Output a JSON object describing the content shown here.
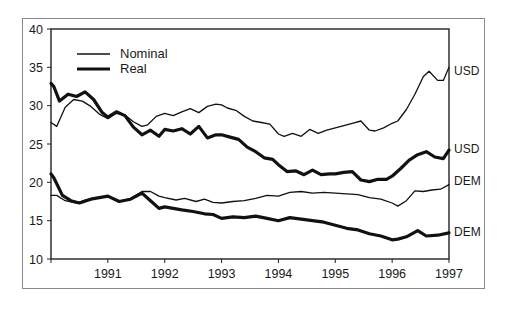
{
  "chart_data": {
    "type": "line",
    "title": "",
    "xlabel": "",
    "ylabel": "",
    "xlim": [
      1990.0,
      1997.0
    ],
    "ylim": [
      10,
      40
    ],
    "y_ticks": [
      10,
      15,
      20,
      25,
      30,
      35,
      40
    ],
    "x_ticks": [
      1991,
      1992,
      1993,
      1994,
      1995,
      1996,
      1997
    ],
    "x_tick_labels": [
      "1991",
      "1992",
      "1993",
      "1994",
      "1995",
      "1996",
      "1997"
    ],
    "grid": false,
    "legend": {
      "position": "upper-left-inside",
      "entries": [
        {
          "label": "Nominal",
          "style": "thin"
        },
        {
          "label": "Real",
          "style": "thick"
        }
      ]
    },
    "series": [
      {
        "name": "USD Nominal",
        "style": "thin",
        "end_label": "USD",
        "x": [
          1990.0,
          1990.1,
          1990.25,
          1990.4,
          1990.55,
          1990.7,
          1990.85,
          1991.0,
          1991.15,
          1991.3,
          1991.45,
          1991.6,
          1991.7,
          1991.85,
          1992.0,
          1992.15,
          1992.3,
          1992.45,
          1992.6,
          1992.75,
          1992.9,
          1993.0,
          1993.1,
          1993.25,
          1993.4,
          1993.55,
          1993.7,
          1993.85,
          1994.0,
          1994.1,
          1994.25,
          1994.4,
          1994.55,
          1994.7,
          1994.85,
          1995.0,
          1995.15,
          1995.3,
          1995.45,
          1995.6,
          1995.7,
          1995.85,
          1996.0,
          1996.1,
          1996.25,
          1996.4,
          1996.55,
          1996.65,
          1996.8,
          1996.9,
          1997.0
        ],
        "values": [
          27.8,
          27.3,
          29.8,
          30.8,
          30.6,
          29.9,
          28.9,
          28.3,
          29.0,
          28.8,
          27.9,
          27.3,
          27.5,
          28.6,
          29.0,
          28.7,
          29.2,
          29.6,
          29.1,
          29.9,
          30.2,
          30.1,
          29.7,
          29.4,
          28.6,
          28.0,
          27.8,
          27.6,
          26.3,
          26.0,
          26.4,
          26.0,
          26.9,
          26.4,
          26.8,
          27.1,
          27.4,
          27.7,
          28.0,
          26.8,
          26.7,
          27.1,
          27.7,
          28.0,
          29.5,
          31.5,
          33.8,
          34.5,
          33.3,
          33.3,
          35.0
        ]
      },
      {
        "name": "USD Real",
        "style": "thick",
        "end_label": "USD",
        "x": [
          1990.0,
          1990.05,
          1990.15,
          1990.3,
          1990.45,
          1990.6,
          1990.75,
          1990.9,
          1991.0,
          1991.15,
          1991.3,
          1991.45,
          1991.6,
          1991.75,
          1991.9,
          1992.0,
          1992.15,
          1992.3,
          1992.45,
          1992.6,
          1992.75,
          1992.9,
          1993.0,
          1993.15,
          1993.3,
          1993.45,
          1993.6,
          1993.75,
          1993.9,
          1994.0,
          1994.15,
          1994.3,
          1994.45,
          1994.6,
          1994.75,
          1994.9,
          1995.0,
          1995.15,
          1995.3,
          1995.45,
          1995.6,
          1995.75,
          1995.9,
          1996.0,
          1996.15,
          1996.3,
          1996.45,
          1996.6,
          1996.75,
          1996.9,
          1997.0
        ],
        "values": [
          32.9,
          32.5,
          30.6,
          31.5,
          31.2,
          31.8,
          30.8,
          29.1,
          28.5,
          29.2,
          28.7,
          27.2,
          26.2,
          26.8,
          26.0,
          26.9,
          26.7,
          27.0,
          26.3,
          27.3,
          25.8,
          26.2,
          26.2,
          25.9,
          25.6,
          24.6,
          24.0,
          23.2,
          23.0,
          22.3,
          21.4,
          21.5,
          21.0,
          21.6,
          21.0,
          21.1,
          21.1,
          21.3,
          21.4,
          20.3,
          20.1,
          20.4,
          20.4,
          20.8,
          21.8,
          22.9,
          23.6,
          24.0,
          23.3,
          23.1,
          24.2
        ]
      },
      {
        "name": "DEM Nominal",
        "style": "thin",
        "end_label": "DEM",
        "x": [
          1990.0,
          1990.1,
          1990.25,
          1990.45,
          1990.6,
          1990.8,
          1991.0,
          1991.2,
          1991.4,
          1991.6,
          1991.75,
          1991.9,
          1992.0,
          1992.2,
          1992.35,
          1992.55,
          1992.7,
          1992.85,
          1993.0,
          1993.2,
          1993.4,
          1993.6,
          1993.8,
          1994.0,
          1994.2,
          1994.4,
          1994.6,
          1994.8,
          1995.0,
          1995.2,
          1995.4,
          1995.6,
          1995.8,
          1996.0,
          1996.1,
          1996.25,
          1996.4,
          1996.55,
          1996.7,
          1996.85,
          1997.0
        ],
        "values": [
          18.3,
          18.3,
          17.6,
          17.3,
          17.7,
          18.0,
          18.2,
          17.5,
          17.9,
          18.8,
          18.8,
          18.2,
          18.0,
          17.7,
          17.9,
          17.5,
          17.8,
          17.4,
          17.3,
          17.5,
          17.6,
          17.9,
          18.3,
          18.2,
          18.7,
          18.8,
          18.6,
          18.7,
          18.6,
          18.5,
          18.4,
          18.0,
          17.8,
          17.3,
          16.9,
          17.6,
          18.9,
          18.8,
          19.0,
          19.1,
          19.7
        ]
      },
      {
        "name": "DEM Real",
        "style": "thick",
        "end_label": "DEM",
        "x": [
          1990.0,
          1990.05,
          1990.2,
          1990.35,
          1990.5,
          1990.7,
          1990.85,
          1991.0,
          1991.2,
          1991.4,
          1991.6,
          1991.75,
          1991.9,
          1992.0,
          1992.15,
          1992.3,
          1992.5,
          1992.7,
          1992.85,
          1993.0,
          1993.2,
          1993.4,
          1993.6,
          1993.8,
          1994.0,
          1994.2,
          1994.4,
          1994.6,
          1994.8,
          1995.0,
          1995.2,
          1995.4,
          1995.6,
          1995.8,
          1996.0,
          1996.1,
          1996.25,
          1996.45,
          1996.6,
          1996.8,
          1997.0
        ],
        "values": [
          21.1,
          20.6,
          18.3,
          17.6,
          17.3,
          17.8,
          18.0,
          18.2,
          17.5,
          17.8,
          18.6,
          17.6,
          16.6,
          16.8,
          16.6,
          16.4,
          16.2,
          15.9,
          15.8,
          15.3,
          15.5,
          15.4,
          15.6,
          15.3,
          15.0,
          15.4,
          15.2,
          15.0,
          14.8,
          14.4,
          14.0,
          13.8,
          13.3,
          13.0,
          12.5,
          12.6,
          12.9,
          13.7,
          13.0,
          13.1,
          13.4
        ]
      }
    ],
    "end_labels": [
      {
        "text": "USD",
        "series": "USD Nominal"
      },
      {
        "text": "USD",
        "series": "USD Real"
      },
      {
        "text": "DEM",
        "series": "DEM Nominal"
      },
      {
        "text": "DEM",
        "series": "DEM Real"
      }
    ]
  }
}
